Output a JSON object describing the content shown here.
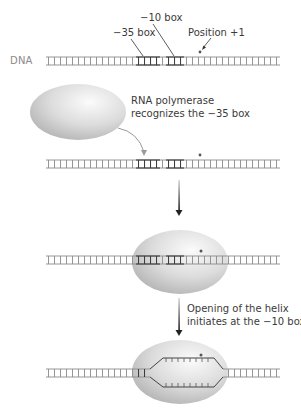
{
  "diagram": {
    "dna_label": "DNA",
    "labels": {
      "minus10": "−10 box",
      "minus35": "−35 box",
      "position1": "Position +1"
    },
    "steps": [
      {
        "caption_line1": "RNA polymerase",
        "caption_line2": "recognizes the −35 box"
      },
      {
        "caption_line1": "Opening of the helix",
        "caption_line2": "initiates at the −10 box"
      }
    ],
    "colors": {
      "strand": "#8a8a8a",
      "strand_dark": "#5a5a5a",
      "polymerase_light": "#f4f4f4",
      "polymerase_dark": "#b5b5b5",
      "arrow": "#333333",
      "curved_arrow": "#9a9a9a"
    }
  }
}
